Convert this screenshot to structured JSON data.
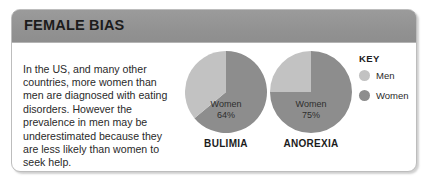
{
  "card": {
    "title": "FEMALE BIAS",
    "body_text": "In the US, and many other countries, more women than men are diagnosed with eating disorders. However the prevalence in men may be underestimated because they are less likely than women to seek help."
  },
  "key": {
    "title": "KEY",
    "items": [
      {
        "label": "Men",
        "color": "#c2c2c2"
      },
      {
        "label": "Women",
        "color": "#8d8d8d"
      }
    ]
  },
  "colors": {
    "men": "#c2c2c2",
    "women": "#8d8d8d",
    "header_bar": "#949494",
    "card_border": "#bdbdbd",
    "text": "#2a2a2a"
  },
  "charts": {
    "bulimia": {
      "caption": "BULIMIA",
      "women_label": "Women",
      "women_pct": "64%"
    },
    "anorexia": {
      "caption": "ANOREXIA",
      "women_label": "Women",
      "women_pct": "75%"
    }
  },
  "chart_data": [
    {
      "type": "pie",
      "title": "BULIMIA",
      "labels": [
        "Women",
        "Men"
      ],
      "values": [
        64,
        36
      ],
      "value_unit": "%",
      "colors": [
        "#8d8d8d",
        "#c2c2c2"
      ],
      "data_labels": [
        "Women 64%",
        ""
      ],
      "legend": [
        "Men",
        "Women"
      ],
      "legend_position": "right",
      "start_angle_deg": 0,
      "direction": "clockwise"
    },
    {
      "type": "pie",
      "title": "ANOREXIA",
      "labels": [
        "Women",
        "Men"
      ],
      "values": [
        75,
        25
      ],
      "value_unit": "%",
      "colors": [
        "#8d8d8d",
        "#c2c2c2"
      ],
      "data_labels": [
        "Women 75%",
        ""
      ],
      "legend": [
        "Men",
        "Women"
      ],
      "legend_position": "right",
      "start_angle_deg": 0,
      "direction": "clockwise"
    }
  ]
}
